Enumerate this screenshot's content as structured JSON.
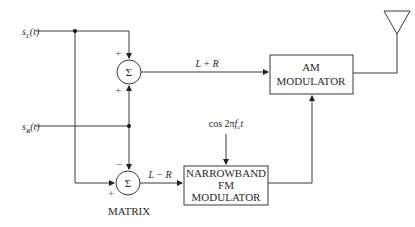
{
  "diagram": {
    "inputs": {
      "left": {
        "symbol": "s",
        "subscript": "L",
        "suffix": "(t)"
      },
      "right": {
        "symbol": "s",
        "subscript": "R",
        "suffix": "(t)"
      }
    },
    "summers": {
      "upper": {
        "glyph": "Σ",
        "sign_top": "+",
        "sign_bottom": "+",
        "output_label": "L + R"
      },
      "lower": {
        "glyph": "Σ",
        "sign_top": "−",
        "sign_left": "+",
        "output_label": "L − R"
      }
    },
    "matrix_label": "MATRIX",
    "blocks": {
      "am_modulator": {
        "lines": [
          "AM",
          "MODULATOR"
        ]
      },
      "nbfm_modulator": {
        "lines": [
          "NARROWBAND",
          "FM",
          "MODULATOR"
        ]
      }
    },
    "carrier": {
      "prefix": "cos 2π",
      "f": "f",
      "subscript": "c",
      "t": "t"
    },
    "antenna": "antenna"
  }
}
